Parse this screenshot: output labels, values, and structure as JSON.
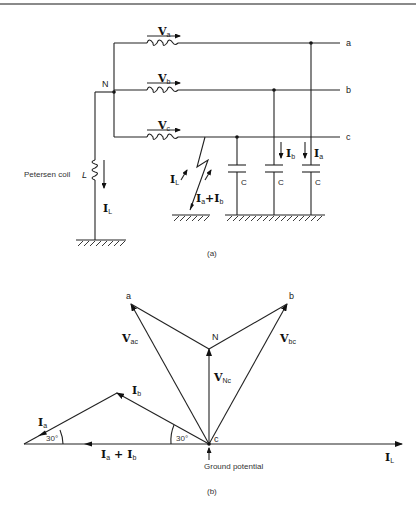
{
  "figure_a": {
    "caption": "(a)",
    "node_neutral": "N",
    "phase_labels": {
      "a": "a",
      "b": "b",
      "c": "c"
    },
    "source_voltages": [
      {
        "main": "V",
        "sub": "a"
      },
      {
        "main": "V",
        "sub": "b"
      },
      {
        "main": "V",
        "sub": "c"
      }
    ],
    "coil_label": "Petersen coil",
    "coil_symbol": "L",
    "coil_current": {
      "main": "I",
      "sub": "L"
    },
    "fault_current_left": {
      "main": "I",
      "sub": "L"
    },
    "fault_current_right": {
      "main": "I",
      "sub": "a",
      "op": "+",
      "main2": "I",
      "sub2": "b"
    },
    "capacitor_labels": [
      "C",
      "C",
      "C"
    ],
    "capacitor_currents": [
      {
        "main": "I",
        "sub": "b"
      },
      {
        "main": "I",
        "sub": "a"
      }
    ]
  },
  "figure_b": {
    "caption": "(b)",
    "points": {
      "a": "a",
      "b": "b",
      "N": "N",
      "c": "c"
    },
    "phasors": {
      "V_ac": {
        "main": "V",
        "sub": "ac"
      },
      "V_bc": {
        "main": "V",
        "sub": "bc"
      },
      "V_Nc": {
        "main": "V",
        "sub": "Nc"
      },
      "I_a": {
        "main": "I",
        "sub": "a"
      },
      "I_b": {
        "main": "I",
        "sub": "b"
      },
      "I_sum": {
        "main": "I",
        "sub": "a",
        "op": "+",
        "main2": "I",
        "sub2": "b"
      },
      "I_L": {
        "main": "I",
        "sub": "L"
      }
    },
    "angles": [
      "30°",
      "30°"
    ],
    "ground_label": "Ground potential"
  }
}
